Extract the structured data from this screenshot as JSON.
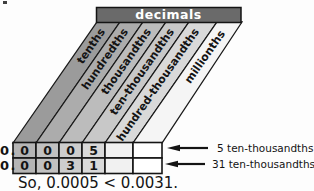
{
  "title": "decimals",
  "place_values": [
    "tenths",
    "hundredths",
    "thousandths",
    "ten-thousandths",
    "hundred-thousandths",
    "millionths"
  ],
  "rows": [
    {
      "prefix": "0.",
      "digits": [
        "0",
        "0",
        "0",
        "5",
        "",
        ""
      ],
      "label": "5 ten-thousandths"
    },
    {
      "prefix": "0.",
      "digits": [
        "0",
        "0",
        "3",
        "1",
        "",
        ""
      ],
      "label": "31 ten-thousandths"
    }
  ],
  "conclusion": "So, 0.0005 < 0.0031.",
  "colors": {
    "header_fill": "#6a6a6a",
    "header_text": "#ffffff",
    "band_fills": [
      "#9b9b9b",
      "#acacac",
      "#bcbcbc",
      "#c8c8c8",
      "#d9d9d9",
      "#f5f5f5"
    ],
    "cell_fills": [
      "#b5b5b5",
      "#c1c1c1",
      "#cdcdcd",
      "#d9d9d9",
      "#f1f1f1",
      "#ffffff"
    ],
    "line": "#141414"
  }
}
